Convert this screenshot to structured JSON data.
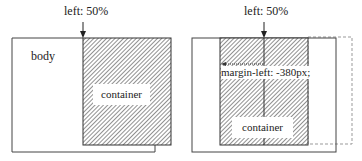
{
  "left_panel": {
    "top_label": "left: 50%",
    "body_label": "body",
    "container_label": "container"
  },
  "right_panel": {
    "top_label": "left: 50%",
    "margin_label": "margin-left: -380px;",
    "container_label": "container"
  },
  "colors": {
    "stroke": "#444444",
    "hatch": "#555555",
    "dashed": "#999999"
  }
}
